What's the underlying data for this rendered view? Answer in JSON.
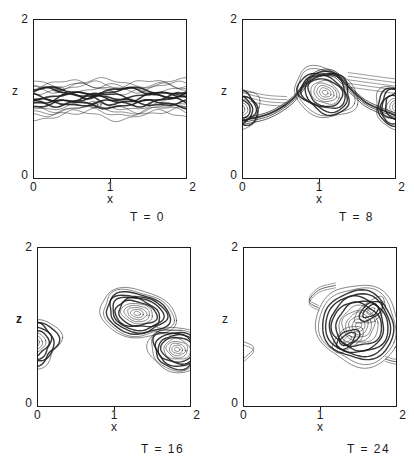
{
  "figure": {
    "background": "#ffffff",
    "ink": "#1c1c1c"
  },
  "chart_data": [
    {
      "type": "contour",
      "title": "T = 0",
      "xlabel": "x",
      "ylabel": "z",
      "xlim": [
        0,
        2
      ],
      "ylim": [
        0,
        2
      ],
      "xticks": [
        0,
        1,
        2
      ],
      "yticks": [
        0,
        2
      ],
      "xtick_labels": [
        "0",
        "1",
        "2"
      ],
      "ytick_labels": [
        "0",
        "2"
      ],
      "features": [
        {
          "kind": "band",
          "center": 1.01,
          "spread": 0.2,
          "lines": 18,
          "amp": 0.05,
          "wavelength": 1.05,
          "core_width": 1.6
        },
        {
          "kind": "blob",
          "x": 0.33,
          "z": 1.12,
          "rx": 0.07,
          "rz": 0.035
        },
        {
          "kind": "blob",
          "x": 0.8,
          "z": 0.93,
          "rx": 0.08,
          "rz": 0.04
        }
      ]
    },
    {
      "type": "contour",
      "title": "T = 8",
      "xlabel": "x",
      "ylabel": "z",
      "xlim": [
        0,
        2
      ],
      "ylim": [
        0,
        2
      ],
      "xticks": [
        0,
        1,
        2
      ],
      "yticks": [
        0,
        2
      ],
      "xtick_labels": [
        "0",
        "1",
        "2"
      ],
      "ytick_labels": [
        "0",
        "2"
      ],
      "features": [
        {
          "kind": "vortex",
          "x": 1.08,
          "z": 1.08,
          "rx": 0.42,
          "rz": 0.3,
          "rings": 11,
          "rot": -20
        },
        {
          "kind": "vortex",
          "x": 2.02,
          "z": 0.9,
          "rx": 0.3,
          "rz": 0.26,
          "rings": 9,
          "rot": -10
        },
        {
          "kind": "vortex",
          "x": -0.03,
          "z": 0.87,
          "rx": 0.27,
          "rz": 0.24,
          "rings": 8,
          "rot": 5
        },
        {
          "kind": "streak",
          "points": [
            [
              0,
              0.72
            ],
            [
              0.35,
              0.8
            ],
            [
              0.65,
              0.98
            ],
            [
              0.92,
              1.28
            ],
            [
              1.18,
              1.32
            ],
            [
              1.4,
              1.12
            ],
            [
              1.6,
              0.95
            ],
            [
              1.82,
              0.85
            ],
            [
              2,
              0.78
            ]
          ],
          "lines": 4,
          "spread": 0.04,
          "width": 1.8
        },
        {
          "kind": "streak",
          "points": [
            [
              1.38,
              1.24
            ],
            [
              1.68,
              1.2
            ],
            [
              2,
              1.16
            ]
          ],
          "lines": 5,
          "spread": 0.09,
          "width": 0.5
        },
        {
          "kind": "streak",
          "points": [
            [
              0,
              1.06
            ],
            [
              0.3,
              0.99
            ],
            [
              0.58,
              0.97
            ]
          ],
          "lines": 4,
          "spread": 0.06,
          "width": 0.5
        }
      ]
    },
    {
      "type": "contour",
      "title": "T = 16",
      "xlabel": "x",
      "ylabel": "z",
      "xlim": [
        0,
        2
      ],
      "ylim": [
        0,
        2
      ],
      "xticks": [
        0,
        1,
        2
      ],
      "yticks": [
        0,
        2
      ],
      "xtick_labels": [
        "0",
        "1",
        "2"
      ],
      "ytick_labels": [
        "0",
        "2"
      ],
      "features": [
        {
          "kind": "vortex",
          "x": -0.05,
          "z": 0.8,
          "rx": 0.35,
          "rz": 0.3,
          "rings": 9,
          "rot": 10
        },
        {
          "kind": "vortex",
          "x": 1.3,
          "z": 1.17,
          "rx": 0.5,
          "rz": 0.3,
          "rings": 12,
          "rot": -10
        },
        {
          "kind": "vortex",
          "x": 1.82,
          "z": 0.72,
          "rx": 0.38,
          "rz": 0.28,
          "rings": 11,
          "rot": -8
        },
        {
          "kind": "streak",
          "points": [
            [
              1.55,
              0.97
            ],
            [
              1.72,
              0.93
            ],
            [
              1.88,
              0.93
            ]
          ],
          "lines": 2,
          "spread": 0.03,
          "width": 0.5
        }
      ]
    },
    {
      "type": "contour",
      "title": "T = 24",
      "xlabel": "x",
      "ylabel": "z",
      "xlim": [
        0,
        2
      ],
      "ylim": [
        0,
        2
      ],
      "xticks": [
        0,
        1,
        2
      ],
      "yticks": [
        0,
        2
      ],
      "xtick_labels": [
        "0",
        "1",
        "2"
      ],
      "ytick_labels": [
        "0",
        "2"
      ],
      "features": [
        {
          "kind": "vortex",
          "x": 1.5,
          "z": 1.02,
          "rx": 0.55,
          "rz": 0.5,
          "rings": 13,
          "rot": -30,
          "swirl": 70
        },
        {
          "kind": "vortex",
          "x": 1.36,
          "z": 0.85,
          "rx": 0.23,
          "rz": 0.12,
          "rings": 4,
          "rot": 35
        },
        {
          "kind": "vortex",
          "x": 1.66,
          "z": 1.2,
          "rx": 0.23,
          "rz": 0.12,
          "rings": 4,
          "rot": 35
        },
        {
          "kind": "streak",
          "points": [
            [
              1.2,
              1.52
            ],
            [
              0.98,
              1.46
            ],
            [
              0.86,
              1.32
            ],
            [
              0.98,
              1.24
            ]
          ],
          "lines": 3,
          "spread": 0.03,
          "width": 0.8
        },
        {
          "kind": "streak",
          "points": [
            [
              1.85,
              0.6
            ],
            [
              2.0,
              0.57
            ],
            [
              2.08,
              0.68
            ]
          ],
          "lines": 3,
          "spread": 0.03,
          "width": 0.8
        },
        {
          "kind": "streak",
          "points": [
            [
              0,
              0.58
            ],
            [
              0.14,
              0.72
            ],
            [
              0,
              0.8
            ]
          ],
          "lines": 2,
          "spread": 0.02,
          "width": 0.6
        }
      ]
    }
  ]
}
